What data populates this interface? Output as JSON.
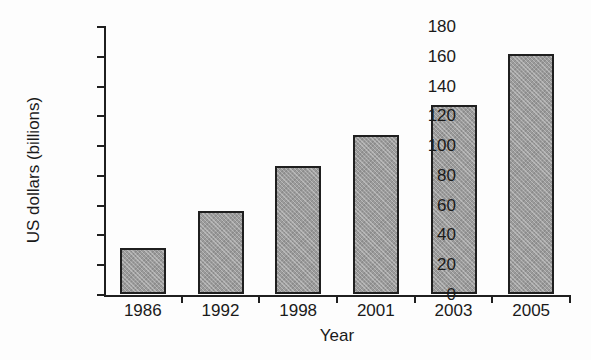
{
  "chart_data": {
    "type": "bar",
    "title": "",
    "subtitle": "",
    "xlabel": "Year",
    "ylabel": "US dollars (billions)",
    "categories": [
      "1986",
      "1992",
      "1998",
      "2001",
      "2003",
      "2005"
    ],
    "values": [
      31,
      56,
      86,
      107,
      127,
      161
    ],
    "series": [
      {
        "name": "US dollars (billions)",
        "values": [
          31,
          56,
          86,
          107,
          127,
          161
        ]
      }
    ],
    "ylim": [
      0,
      180
    ],
    "y_ticks": [
      0,
      20,
      40,
      60,
      80,
      100,
      120,
      140,
      160,
      180
    ],
    "y_tick_labels": [
      "0",
      "20",
      "40",
      "60",
      "80",
      "100",
      "120",
      "140",
      "160",
      "180"
    ],
    "x_tick_labels": [
      "1986",
      "1992",
      "1998",
      "2001",
      "2003",
      "2005"
    ],
    "grid": false,
    "legend": false,
    "legend_position": "none",
    "annotations": [],
    "bar_fill_color": "#9b9b9b",
    "bar_edge_color": "#1f1f1f",
    "axis_color": "#1f1f1f",
    "background_color": "#ffffff"
  }
}
